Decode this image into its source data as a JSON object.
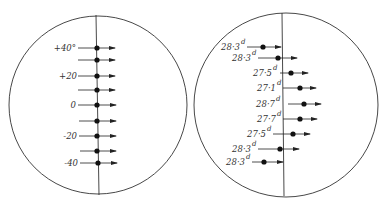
{
  "figure": {
    "left_panel": {
      "circle": {
        "cx": 98,
        "cy": 105,
        "r": 89
      },
      "axis_x": 97,
      "labels": {
        "r0": "+40°",
        "r2": "+20",
        "r4": "0",
        "r6": "-20",
        "r8": "-40"
      },
      "rows": [
        {
          "y": 48,
          "label": "+40°",
          "line_from": 78,
          "dot_x": 97,
          "arrow_to": 115
        },
        {
          "y": 60,
          "label": "",
          "line_from": 78,
          "dot_x": 97,
          "arrow_to": 115
        },
        {
          "y": 76,
          "label": "+20",
          "line_from": 78,
          "dot_x": 97,
          "arrow_to": 115
        },
        {
          "y": 90,
          "label": "",
          "line_from": 78,
          "dot_x": 97,
          "arrow_to": 115
        },
        {
          "y": 105,
          "label": "0",
          "line_from": 78,
          "dot_x": 97,
          "arrow_to": 116
        },
        {
          "y": 121,
          "label": "",
          "line_from": 79,
          "dot_x": 97,
          "arrow_to": 116
        },
        {
          "y": 136,
          "label": "-20",
          "line_from": 79,
          "dot_x": 97,
          "arrow_to": 116
        },
        {
          "y": 151,
          "label": "",
          "line_from": 80,
          "dot_x": 97,
          "arrow_to": 116
        },
        {
          "y": 163,
          "label": "-40",
          "line_from": 80,
          "dot_x": 98,
          "arrow_to": 117
        }
      ]
    },
    "right_panel": {
      "circle": {
        "cx": 286,
        "cy": 105,
        "r": 92
      },
      "axis_x": 283,
      "labels": {
        "r0": "28·3",
        "r1": "28·3",
        "r2": "27·5",
        "r3": "27·1",
        "r4": "28·7",
        "r5": "27·7",
        "r6": "27·5",
        "r7": "28·3",
        "r8": "28·3",
        "unit": "d"
      },
      "rows": [
        {
          "y": 47,
          "label": "28·3",
          "line_from": 247,
          "dot_x": 263,
          "arrow_to": 281
        },
        {
          "y": 58,
          "label": "28·3",
          "line_from": 258,
          "dot_x": 278,
          "arrow_to": 297
        },
        {
          "y": 73,
          "label": "27·5",
          "line_from": 280,
          "dot_x": 291,
          "arrow_to": 308
        },
        {
          "y": 88,
          "label": "27·1",
          "line_from": 283,
          "dot_x": 300,
          "arrow_to": 316
        },
        {
          "y": 104,
          "label": "28·7",
          "line_from": 288,
          "dot_x": 304,
          "arrow_to": 321
        },
        {
          "y": 119,
          "label": "27·7",
          "line_from": 283,
          "dot_x": 300,
          "arrow_to": 317
        },
        {
          "y": 134,
          "label": "27·5",
          "line_from": 273,
          "dot_x": 293,
          "arrow_to": 310
        },
        {
          "y": 149,
          "label": "28·3",
          "line_from": 258,
          "dot_x": 280,
          "arrow_to": 299
        },
        {
          "y": 162,
          "label": "28·3",
          "line_from": 252,
          "dot_x": 264,
          "arrow_to": 283
        }
      ]
    },
    "colors": {
      "ink": "#222222",
      "background": "#ffffff"
    }
  }
}
